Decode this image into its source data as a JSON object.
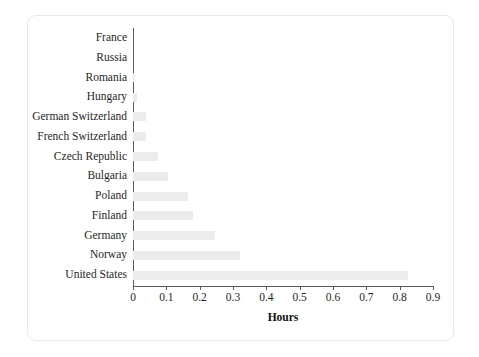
{
  "chart_data": {
    "type": "bar",
    "orientation": "horizontal",
    "title": "",
    "xlabel": "Hours",
    "ylabel": "",
    "xlim": [
      0,
      0.9
    ],
    "xticks": [
      "0",
      "0.1",
      "0.2",
      "0.3",
      "0.4",
      "0.5",
      "0.6",
      "0.7",
      "0.8",
      "0.9"
    ],
    "xtick_values": [
      0,
      0.1,
      0.2,
      0.3,
      0.4,
      0.5,
      0.6,
      0.7,
      0.8,
      0.9
    ],
    "grid": false,
    "legend": false,
    "bar_color": "#ececec",
    "axis_color": "#5a5a5a",
    "categories": [
      "France",
      "Russia",
      "Romania",
      "Hungary",
      "German Switzerland",
      "French Switzerland",
      "Czech Republic",
      "Bulgaria",
      "Poland",
      "Finland",
      "Germany",
      "Norway",
      "United States"
    ],
    "values": [
      0.0,
      0.0,
      0.005,
      0.012,
      0.04,
      0.04,
      0.075,
      0.105,
      0.165,
      0.18,
      0.245,
      0.32,
      0.825
    ]
  }
}
